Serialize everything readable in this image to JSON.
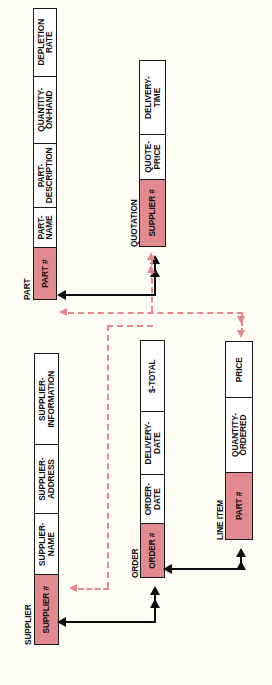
{
  "diagram": {
    "orientation": "rotated-90",
    "background_color": "#fdfdf4",
    "key_fill_color": "#e28a90",
    "solid_link_color": "#0d0d0d",
    "dashed_link_color": "#e8868d"
  },
  "entities": [
    {
      "name": "PART",
      "fields": [
        {
          "label": "PART #",
          "key": true
        },
        {
          "label": "PART-\nNAME",
          "key": false
        },
        {
          "label": "PART-\nDESCRIPTION",
          "key": false
        },
        {
          "label": "QUANTITY-\nON-HAND",
          "key": false
        },
        {
          "label": "DEPLETION\nRATE",
          "key": false
        }
      ]
    },
    {
      "name": "QUOTATION",
      "fields": [
        {
          "label": "SUPPLIER #",
          "key": true
        },
        {
          "label": "QUOTE-\nPRICE",
          "key": false
        },
        {
          "label": "DELIVERY-\nTIME",
          "key": false
        }
      ]
    },
    {
      "name": "SUPPLIER",
      "fields": [
        {
          "label": "SUPPLIER #",
          "key": true
        },
        {
          "label": "SUPPLIER-\nNAME",
          "key": false
        },
        {
          "label": "SUPPLIER-\nADDRESS",
          "key": false
        },
        {
          "label": "SUPPLIER-\nINFORMATION",
          "key": false
        }
      ]
    },
    {
      "name": "ORDER",
      "fields": [
        {
          "label": "ORDER #",
          "key": true
        },
        {
          "label": "ORDER-\nDATE",
          "key": false
        },
        {
          "label": "DELIVERY-\nDATE",
          "key": false
        },
        {
          "label": "$-TOTAL",
          "key": false
        }
      ]
    },
    {
      "name": "LINE ITEM",
      "fields": [
        {
          "label": "PART #",
          "key": true
        },
        {
          "label": "QUANTITY-\nORDERED",
          "key": false
        },
        {
          "label": "PRICE",
          "key": false
        }
      ]
    }
  ],
  "links": [
    {
      "from": "QUOTATION",
      "to": "PART",
      "style": "solid"
    },
    {
      "from": "PART",
      "to": "LINE ITEM",
      "style": "dashed"
    },
    {
      "from": "SUPPLIER",
      "to": "QUOTATION",
      "style": "dashed"
    },
    {
      "from": "LINE ITEM",
      "to": "ORDER",
      "style": "solid"
    },
    {
      "from": "ORDER",
      "to": "SUPPLIER",
      "style": "solid"
    }
  ]
}
